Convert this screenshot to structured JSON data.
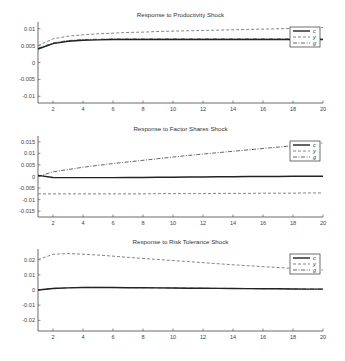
{
  "chart_data": [
    {
      "type": "line",
      "title": "Response to Productivity Shock",
      "xlabel": "",
      "ylabel": "",
      "xlim": [
        1,
        20
      ],
      "ylim": [
        -0.012,
        0.012
      ],
      "xticks": [
        2,
        4,
        6,
        8,
        10,
        12,
        14,
        16,
        18,
        20
      ],
      "yticks": [
        0.01,
        0.005,
        0,
        -0.005,
        -0.01
      ],
      "ytick_labels": [
        "0.01",
        "0.005",
        "0",
        "-0.005",
        "-0.01"
      ],
      "grid": false,
      "legend_position": "upper right",
      "x": [
        1,
        2,
        3,
        4,
        5,
        6,
        7,
        8,
        9,
        10,
        11,
        12,
        13,
        14,
        15,
        16,
        17,
        18,
        19,
        20
      ],
      "series": [
        {
          "name": "c",
          "style": "solid",
          "values": [
            0.004,
            0.0056,
            0.0063,
            0.0066,
            0.0067,
            0.0068,
            0.0068,
            0.0068,
            0.0068,
            0.0068,
            0.0068,
            0.0068,
            0.0068,
            0.0068,
            0.0068,
            0.0068,
            0.0068,
            0.0068,
            0.0068,
            0.0068
          ]
        },
        {
          "name": "y",
          "style": "dashed",
          "values": [
            0.005,
            0.007,
            0.0078,
            0.0082,
            0.0085,
            0.0087,
            0.0089,
            0.009,
            0.0092,
            0.0093,
            0.0094,
            0.0095,
            0.0096,
            0.0097,
            0.0098,
            0.0099,
            0.01,
            0.0101,
            0.0103,
            0.0104
          ]
        },
        {
          "name": "g",
          "style": "dashdot",
          "values": [
            0.0042,
            0.0058,
            0.0065,
            0.0068,
            0.0069,
            0.007,
            0.007,
            0.007,
            0.007,
            0.007,
            0.007,
            0.007,
            0.007,
            0.007,
            0.007,
            0.007,
            0.007,
            0.007,
            0.007,
            0.007
          ]
        }
      ]
    },
    {
      "type": "line",
      "title": "Response to Factor Shares Shock",
      "xlabel": "",
      "ylabel": "",
      "xlim": [
        1,
        20
      ],
      "ylim": [
        -0.0175,
        0.0175
      ],
      "xticks": [
        2,
        4,
        6,
        8,
        10,
        12,
        14,
        16,
        18,
        20
      ],
      "yticks": [
        0.015,
        0.01,
        0.005,
        0,
        -0.005,
        -0.01,
        -0.015
      ],
      "ytick_labels": [
        "0.015",
        "0.01",
        "0.005",
        "0",
        "-0.005",
        "-0.01",
        "-0.015"
      ],
      "grid": false,
      "legend_position": "upper right",
      "x": [
        1,
        2,
        3,
        4,
        5,
        6,
        7,
        8,
        9,
        10,
        11,
        12,
        13,
        14,
        15,
        16,
        17,
        18,
        19,
        20
      ],
      "series": [
        {
          "name": "c",
          "style": "solid",
          "values": [
            0.0005,
            -0.0004,
            -0.0005,
            -0.0005,
            -0.0005,
            -0.0005,
            -0.0004,
            -0.0004,
            -0.0003,
            -0.0003,
            -0.0002,
            -0.0002,
            -0.0001,
            -0.0001,
            0.0,
            0.0,
            0.0,
            0.0001,
            0.0001,
            0.0001
          ]
        },
        {
          "name": "y",
          "style": "dashed",
          "values": [
            -0.0075,
            -0.0075,
            -0.0075,
            -0.0075,
            -0.0075,
            -0.0075,
            -0.0075,
            -0.0075,
            -0.0074,
            -0.0074,
            -0.0074,
            -0.0074,
            -0.0073,
            -0.0073,
            -0.0073,
            -0.0072,
            -0.0072,
            -0.0072,
            -0.0071,
            -0.0071
          ]
        },
        {
          "name": "g",
          "style": "dashdot",
          "values": [
            0.0,
            0.002,
            0.003,
            0.004,
            0.0048,
            0.0056,
            0.0063,
            0.007,
            0.0077,
            0.0084,
            0.0091,
            0.0097,
            0.0103,
            0.0109,
            0.0115,
            0.0121,
            0.0127,
            0.0133,
            0.0139,
            0.0145
          ]
        }
      ]
    },
    {
      "type": "line",
      "title": "Response to Risk Tolerance Shock",
      "xlabel": "",
      "ylabel": "",
      "xlim": [
        1,
        20
      ],
      "ylim": [
        -0.027,
        0.027
      ],
      "xticks": [
        2,
        4,
        6,
        8,
        10,
        12,
        14,
        16,
        18,
        20
      ],
      "yticks": [
        0.02,
        0.01,
        0,
        -0.01,
        -0.02
      ],
      "ytick_labels": [
        "0.02",
        "0.01",
        "0",
        "-0.01",
        "-0.02"
      ],
      "grid": false,
      "legend_position": "upper right",
      "x": [
        1,
        2,
        3,
        4,
        5,
        6,
        7,
        8,
        9,
        10,
        11,
        12,
        13,
        14,
        15,
        16,
        17,
        18,
        19,
        20
      ],
      "series": [
        {
          "name": "c",
          "style": "solid",
          "values": [
            0.0,
            0.001,
            0.0014,
            0.0016,
            0.0016,
            0.0016,
            0.0015,
            0.0015,
            0.0014,
            0.0013,
            0.0012,
            0.0012,
            0.0011,
            0.001,
            0.0009,
            0.0008,
            0.0008,
            0.0007,
            0.0006,
            0.0006
          ]
        },
        {
          "name": "y",
          "style": "dashed",
          "values": [
            0.02,
            0.0235,
            0.024,
            0.0236,
            0.023,
            0.0223,
            0.0215,
            0.0208,
            0.0201,
            0.0194,
            0.0187,
            0.018,
            0.0173,
            0.0166,
            0.016,
            0.0154,
            0.0148,
            0.0142,
            0.0137,
            0.0132
          ]
        },
        {
          "name": "g",
          "style": "dashdot",
          "values": [
            0.0001,
            0.0011,
            0.0015,
            0.0017,
            0.0017,
            0.0016,
            0.0016,
            0.0015,
            0.0014,
            0.0013,
            0.0013,
            0.0012,
            0.0011,
            0.001,
            0.0009,
            0.0009,
            0.0008,
            0.0007,
            0.0007,
            0.0006
          ]
        }
      ]
    }
  ],
  "layout": {
    "panels": [
      {
        "top": 22,
        "bottom": 103,
        "title_y": 17
      },
      {
        "top": 136,
        "bottom": 217,
        "title_y": 131
      },
      {
        "top": 249,
        "bottom": 331,
        "title_y": 244
      }
    ],
    "plot_left": 38,
    "plot_right": 323
  },
  "styles": {
    "c": {
      "color": "#222222",
      "width": 1.4,
      "dash": ""
    },
    "y": {
      "color": "#777777",
      "width": 0.9,
      "dash": "3,2"
    },
    "g": {
      "color": "#555555",
      "width": 0.9,
      "dash": "4,1.5,1,1.5"
    }
  }
}
